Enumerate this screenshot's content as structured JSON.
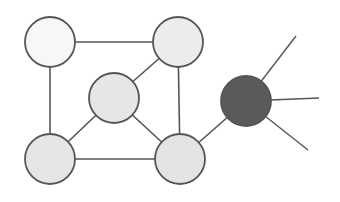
{
  "diagram": {
    "type": "graph",
    "width": 340,
    "height": 202,
    "colors": {
      "background": "#ffffff",
      "stroke": "#555555",
      "node_light": "#f7f7f7",
      "node_gray": "#e6e6e6",
      "node_dark": "#5a5a5a"
    },
    "nodes": [
      {
        "id": "top-left",
        "cx": 50,
        "cy": 42,
        "r": 25,
        "fill": "#f7f7f7"
      },
      {
        "id": "top-right",
        "cx": 178,
        "cy": 42,
        "r": 25,
        "fill": "#ececec"
      },
      {
        "id": "middle",
        "cx": 114,
        "cy": 98,
        "r": 25,
        "fill": "#e6e6e6"
      },
      {
        "id": "bottom-left",
        "cx": 50,
        "cy": 159,
        "r": 25,
        "fill": "#e6e6e6"
      },
      {
        "id": "bottom-right",
        "cx": 180,
        "cy": 159,
        "r": 25,
        "fill": "#e4e4e4"
      },
      {
        "id": "hub",
        "cx": 246,
        "cy": 101,
        "r": 25,
        "fill": "#5a5a5a"
      }
    ],
    "edges": [
      {
        "from": "top-left",
        "to": "top-right"
      },
      {
        "from": "top-left",
        "to": "bottom-left"
      },
      {
        "from": "top-right",
        "to": "middle"
      },
      {
        "from": "top-right",
        "to": "bottom-right"
      },
      {
        "from": "middle",
        "to": "bottom-left"
      },
      {
        "from": "middle",
        "to": "bottom-right"
      },
      {
        "from": "bottom-left",
        "to": "bottom-right"
      },
      {
        "from": "bottom-right",
        "to": "hub"
      }
    ],
    "spokes": [
      {
        "from": "hub",
        "x2": 296,
        "y2": 36
      },
      {
        "from": "hub",
        "x2": 319,
        "y2": 98
      },
      {
        "from": "hub",
        "x2": 308,
        "y2": 150
      }
    ]
  }
}
